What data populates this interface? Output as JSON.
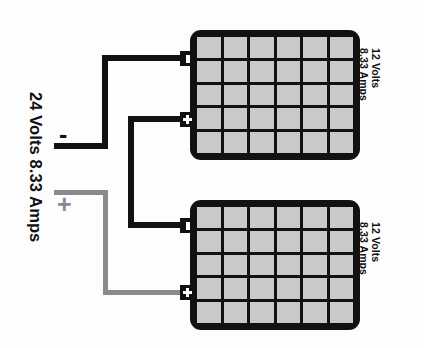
{
  "diagram": {
    "system_label": "24 Volts 8.33 Amps",
    "negative_sign": "-",
    "positive_sign": "+",
    "colors": {
      "negative_wire": "#111111",
      "positive_wire": "#8a8a8a",
      "battery_case": "#111111",
      "battery_cell": "#c9c9c9",
      "background": "#fdfdfd"
    },
    "batteries": [
      {
        "id": "battery-top",
        "volts_label": "12 Volts",
        "amps_label": "8.33 Amps",
        "grid_columns": 6,
        "grid_rows": 5,
        "terminals": [
          {
            "id": "top-negative",
            "type": "negative",
            "symbol": "-"
          },
          {
            "id": "top-positive",
            "type": "positive",
            "symbol": "+"
          }
        ]
      },
      {
        "id": "battery-bottom",
        "volts_label": "12 Volts",
        "amps_label": "8.33 Amps",
        "grid_columns": 6,
        "grid_rows": 5,
        "terminals": [
          {
            "id": "bottom-negative",
            "type": "negative",
            "symbol": "-"
          },
          {
            "id": "bottom-positive",
            "type": "positive",
            "symbol": "+"
          }
        ]
      }
    ],
    "wires": [
      {
        "id": "wire-load-negative",
        "name": "load-negative-wire",
        "color": "#111111",
        "from": "load-negative",
        "to": "battery-top-negative"
      },
      {
        "id": "wire-series-link",
        "name": "series-link-wire",
        "color": "#111111",
        "from": "battery-top-positive",
        "to": "battery-bottom-negative"
      },
      {
        "id": "wire-load-positive",
        "name": "load-positive-wire",
        "color": "#8a8a8a",
        "from": "load-positive",
        "to": "battery-bottom-positive"
      }
    ]
  }
}
